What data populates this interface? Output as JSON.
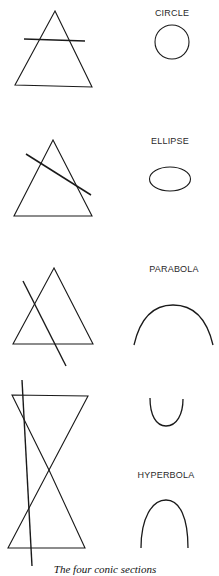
{
  "figure": {
    "caption": "The four conic sections",
    "stroke_color": "#1a1a1a",
    "sections": [
      {
        "name": "circle",
        "label": "CIRCLE",
        "cut": "horizontal plane parallel to base"
      },
      {
        "name": "ellipse",
        "label": "ELLIPSE",
        "cut": "tilted plane crossing both sides"
      },
      {
        "name": "parabola",
        "label": "PARABOLA",
        "cut": "plane parallel to cone side"
      },
      {
        "name": "hyperbola",
        "label": "HYPERBOLA",
        "cut": "near-vertical plane through double cone"
      }
    ]
  }
}
